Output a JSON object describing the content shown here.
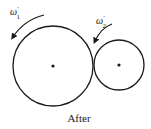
{
  "diagram": {
    "caption": "After",
    "gear_large": {
      "label_symbol": "ω",
      "label_prime": "′",
      "label_subscript": "1",
      "center": [
        53,
        66
      ],
      "radius": 40
    },
    "gear_small": {
      "label_symbol": "ω",
      "label_prime": "′",
      "label_subscript": "2",
      "center": [
        119,
        65
      ],
      "radius": 25
    },
    "colors": {
      "stroke": "#1a1a1a",
      "background": "#ffffff"
    }
  }
}
